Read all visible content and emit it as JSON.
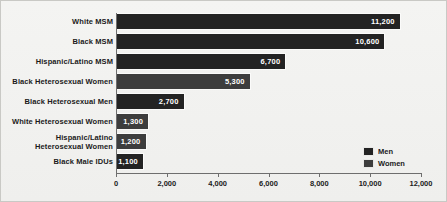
{
  "chart_data": {
    "type": "bar",
    "orientation": "horizontal",
    "title": "",
    "xlabel": "",
    "ylabel": "",
    "xlim": [
      0,
      12000
    ],
    "xticks": [
      "0",
      "2,000",
      "4,000",
      "6,000",
      "8,000",
      "10,000",
      "12,000"
    ],
    "xtick_values": [
      0,
      2000,
      4000,
      6000,
      8000,
      10000,
      12000
    ],
    "grid": false,
    "legend_position": "bottom-right",
    "categories": [
      "White MSM",
      "Black MSM",
      "Hispanic/Latino MSM",
      "Black Heterosexual Women",
      "Black Heterosexual Men",
      "White Heterosexual Women",
      "Hispanic/Latino\nHeterosexual Women",
      "Black Male IDUs"
    ],
    "values": [
      11200,
      10600,
      6700,
      5300,
      2700,
      1300,
      1200,
      1100
    ],
    "value_labels": [
      "11,200",
      "10,600",
      "6,700",
      "5,300",
      "2,700",
      "1,300",
      "1,200",
      "1,100"
    ],
    "series_of_point": [
      "Men",
      "Men",
      "Men",
      "Women",
      "Men",
      "Women",
      "Women",
      "Men"
    ],
    "series": [
      {
        "name": "Men",
        "color": "#232323"
      },
      {
        "name": "Women",
        "color": "#3d3d3d"
      }
    ]
  },
  "bars": [
    {
      "label": "White MSM",
      "label_line2": "",
      "value": 11200,
      "value_label": "11,200",
      "group": "men"
    },
    {
      "label": "Black MSM",
      "label_line2": "",
      "value": 10600,
      "value_label": "10,600",
      "group": "men"
    },
    {
      "label": "Hispanic/Latino MSM",
      "label_line2": "",
      "value": 6700,
      "value_label": "6,700",
      "group": "men"
    },
    {
      "label": "Black Heterosexual Women",
      "label_line2": "",
      "value": 5300,
      "value_label": "5,300",
      "group": "women"
    },
    {
      "label": "Black Heterosexual Men",
      "label_line2": "",
      "value": 2700,
      "value_label": "2,700",
      "group": "men"
    },
    {
      "label": "White Heterosexual Women",
      "label_line2": "",
      "value": 1300,
      "value_label": "1,300",
      "group": "women"
    },
    {
      "label": "Hispanic/Latino",
      "label_line2": "Heterosexual Women",
      "value": 1200,
      "value_label": "1,200",
      "group": "women"
    },
    {
      "label": "Black Male IDUs",
      "label_line2": "",
      "value": 1100,
      "value_label": "1,100",
      "group": "men"
    }
  ],
  "axis": {
    "ticks": [
      {
        "label": "0",
        "value": 0
      },
      {
        "label": "2,000",
        "value": 2000
      },
      {
        "label": "4,000",
        "value": 4000
      },
      {
        "label": "6,000",
        "value": 6000
      },
      {
        "label": "8,000",
        "value": 8000
      },
      {
        "label": "10,000",
        "value": 10000
      },
      {
        "label": "12,000",
        "value": 12000
      }
    ]
  },
  "legend": {
    "items": [
      {
        "label": "Men",
        "group": "men"
      },
      {
        "label": "Women",
        "group": "women"
      }
    ]
  },
  "colors": {
    "men": "#232323",
    "women": "#3d3d3d",
    "background": "#f2f2f0",
    "axis": "#6e6e6e",
    "text": "#1b1b1b"
  }
}
